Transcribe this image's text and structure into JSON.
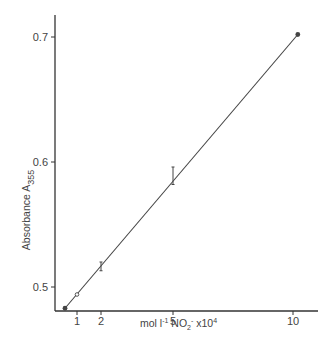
{
  "chart_data": {
    "type": "scatter",
    "title": "",
    "xlabel": "mol l⁻¹ NO₂⁻ x10⁴",
    "xlabel_parts": {
      "main": "mol l",
      "sup1": "-1",
      "species": " NO",
      "sub": "2",
      "sup2": "-",
      "tail": " x10",
      "sup3": "4"
    },
    "ylabel": "Absorbance A355",
    "ylabel_parts": {
      "main": "Absorbance  A",
      "sub": "355"
    },
    "xlim": [
      0,
      11
    ],
    "ylim": [
      0.48,
      0.73
    ],
    "x_ticks": [
      1,
      2,
      5,
      10
    ],
    "x_tick_labels": [
      "1",
      "2",
      "5",
      "10"
    ],
    "y_ticks": [
      0.5,
      0.6,
      0.7
    ],
    "y_tick_labels": [
      "0.5",
      "0.6",
      "0.7"
    ],
    "grid": false,
    "legend": null,
    "series": [
      {
        "name": "measured",
        "points": [
          {
            "x": 0.5,
            "y": 0.483,
            "marker": "filled",
            "err": null
          },
          {
            "x": 1,
            "y": 0.494,
            "marker": "open",
            "err": null
          },
          {
            "x": 2,
            "y": 0.516,
            "marker": "errorbar",
            "err": [
              0.513,
              0.52
            ]
          },
          {
            "x": 5,
            "y": 0.589,
            "marker": "errorbar",
            "err": [
              0.582,
              0.596
            ]
          },
          {
            "x": 10.2,
            "y": 0.702,
            "marker": "filled",
            "err": null
          }
        ]
      }
    ],
    "fit_line": {
      "x": [
        0.5,
        10.2
      ],
      "y": [
        0.483,
        0.702
      ]
    },
    "colors": {
      "line": "#444444",
      "axis": "#333333",
      "text": "#444444"
    }
  }
}
